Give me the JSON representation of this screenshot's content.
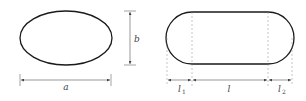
{
  "diagram": {
    "left_figure": {
      "shape": "ellipse",
      "labels": {
        "width": "a",
        "height": "b"
      }
    },
    "right_figure": {
      "shape": "stadium",
      "labels": {
        "left_cap": "l",
        "left_cap_sub": "1",
        "middle": "l",
        "right_cap": "l",
        "right_cap_sub": "2"
      }
    },
    "colors": {
      "outline": "#1a1a1a",
      "dimension": "#555555",
      "dashed": "#888888"
    }
  }
}
